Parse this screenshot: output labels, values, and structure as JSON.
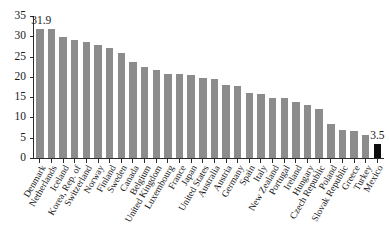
{
  "chart_data": {
    "type": "bar",
    "title": "",
    "subtitle": "",
    "xlabel": "",
    "ylabel": "",
    "ylim": [
      0,
      35
    ],
    "yticks": [
      0,
      5,
      10,
      15,
      20,
      25,
      30,
      35
    ],
    "grid": false,
    "legend": null,
    "highlight_color": "#0d0d0d",
    "bar_color": "#8c8c8c",
    "highlighted_categories": [
      "Mexico"
    ],
    "annotations": [
      {
        "category": "Denmark",
        "text": "31.9"
      },
      {
        "category": "Mexico",
        "text": "3.5"
      }
    ],
    "categories": [
      "Denmark",
      "Netherlands",
      "Iceland",
      "Korea, Rep. of",
      "Switzerland",
      "Norway",
      "Finland",
      "Sweden",
      "Canada",
      "Belgium",
      "United Kingdom",
      "Luxembourg",
      "France",
      "Japan",
      "United States",
      "Australia",
      "Austria",
      "Germany",
      "Spain",
      "Italy",
      "New Zealand",
      "Portugal",
      "Ireland",
      "Hungary",
      "Czech Republic",
      "Poland",
      "Slovak Republic",
      "Greece",
      "Turkey",
      "Mexico"
    ],
    "values": [
      31.9,
      31.9,
      29.8,
      29.1,
      28.5,
      27.9,
      27.2,
      26.0,
      23.6,
      22.4,
      21.7,
      20.6,
      20.6,
      20.5,
      19.6,
      19.5,
      17.9,
      17.7,
      16.0,
      15.8,
      14.8,
      14.8,
      13.8,
      13.0,
      12.0,
      8.5,
      6.9,
      6.6,
      5.6,
      3.5
    ]
  }
}
